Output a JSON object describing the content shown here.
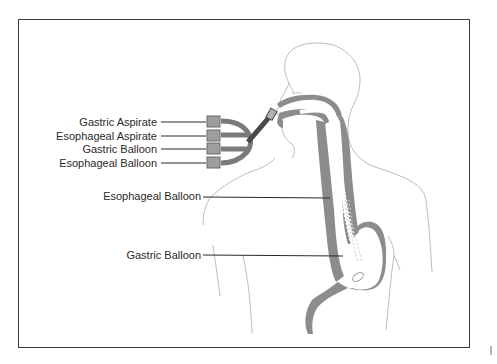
{
  "diagram": {
    "colors": {
      "frame": "#3a3a3a",
      "organ": "#8c8c8c",
      "tube": "#7a7a7a",
      "port": "#9e9e9e",
      "outline": "#bdbdbd",
      "leader": "#2a2a2a",
      "text": "#2a2a2a"
    },
    "port_labels": [
      {
        "id": "gastric-aspirate",
        "text": "Gastric Aspirate"
      },
      {
        "id": "esophageal-aspirate",
        "text": "Esophageal Aspirate"
      },
      {
        "id": "gastric-balloon-port",
        "text": "Gastric Balloon"
      },
      {
        "id": "esophageal-balloon-port",
        "text": "Esophageal Balloon"
      }
    ],
    "anatomy_labels": [
      {
        "id": "esophageal-balloon",
        "text": "Esophageal Balloon"
      },
      {
        "id": "gastric-balloon",
        "text": "Gastric Balloon"
      }
    ]
  }
}
